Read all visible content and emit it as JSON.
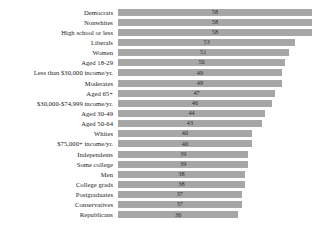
{
  "chart_data": {
    "type": "bar",
    "orientation": "horizontal",
    "title": "",
    "subtitle": "",
    "xlabel": "",
    "ylabel": "",
    "grid": false,
    "legend": null,
    "xlim": [
      0,
      58
    ],
    "value_labels_shown": true,
    "bar_color": "#a6a6a6",
    "categories": [
      "Democrats",
      "Nonwhites",
      "High school or less",
      "Liberals",
      "Women",
      "Aged 18-29",
      "Less than $30,000 income/yr.",
      "Moderates",
      "Aged 65+",
      "$30,000-$74,999 income/yr.",
      "Aged 30-49",
      "Aged 50-64",
      "Whites",
      "$75,000+ income/yr.",
      "Independents",
      "Some college",
      "Men",
      "College grads",
      "Postgraduates",
      "Conservatives",
      "Republicans"
    ],
    "values": [
      58,
      58,
      58,
      53,
      51,
      50,
      49,
      49,
      47,
      46,
      44,
      43,
      40,
      40,
      39,
      39,
      38,
      38,
      37,
      37,
      36
    ]
  }
}
